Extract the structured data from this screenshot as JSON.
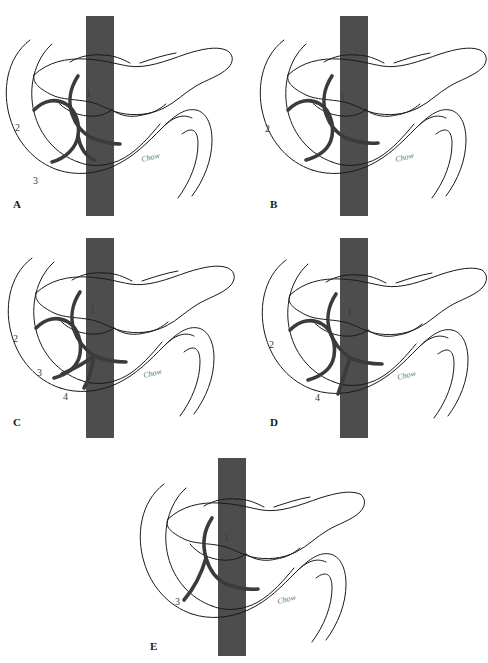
{
  "figure": {
    "title_running_head_left": "",
    "title_running_head_right": "",
    "background_color": "#ffffff",
    "ink_color": "#1a1a1a",
    "duct_color": "#3b3b3b",
    "vessel_bar_color": "#4d4d4d",
    "label_color": "#3a3a3a",
    "signature_mark": "Chow",
    "panel_count": 5
  },
  "panels": [
    {
      "id": "a",
      "letter": "A",
      "caption": "",
      "labels": [
        {
          "text": "1",
          "x": 86,
          "y": 81
        },
        {
          "text": "2",
          "x": 15,
          "y": 115
        },
        {
          "text": "3",
          "x": 33,
          "y": 168
        }
      ],
      "signature": "Chow"
    },
    {
      "id": "b",
      "letter": "B",
      "caption": "",
      "labels": [
        {
          "text": "1",
          "x": 96,
          "y": 84
        },
        {
          "text": "2",
          "x": 21,
          "y": 116
        }
      ],
      "signature": "Chow"
    },
    {
      "id": "c",
      "letter": "C",
      "caption": "",
      "labels": [
        {
          "text": "1",
          "x": 90,
          "y": 75
        },
        {
          "text": "2",
          "x": 13,
          "y": 104
        },
        {
          "text": "3",
          "x": 37,
          "y": 138
        },
        {
          "text": "4",
          "x": 63,
          "y": 162
        }
      ],
      "signature": "Chow"
    },
    {
      "id": "d",
      "letter": "D",
      "caption": "",
      "labels": [
        {
          "text": "1",
          "x": 103,
          "y": 78
        },
        {
          "text": "2",
          "x": 25,
          "y": 110
        },
        {
          "text": "4",
          "x": 71,
          "y": 163
        }
      ],
      "signature": "Chow"
    },
    {
      "id": "e",
      "letter": "E",
      "caption": "",
      "labels": [
        {
          "text": "1",
          "x": 102,
          "y": 87
        },
        {
          "text": "3",
          "x": 53,
          "y": 151
        }
      ],
      "signature": "Chow"
    }
  ],
  "panel_letters": {
    "a": "A",
    "b": "B",
    "c": "C",
    "d": "D",
    "e": "E"
  }
}
